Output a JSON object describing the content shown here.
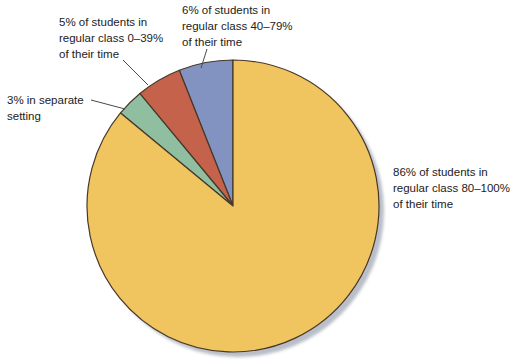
{
  "figure": {
    "kind": "pie-chart-figure",
    "background": "#ffffff",
    "text_color": "#222222",
    "leader_line_color": "#4a4a4a"
  },
  "chart_data": {
    "type": "pie",
    "title": "",
    "start_angle_deg": 90,
    "direction": "counterclockwise",
    "outline_color": "#473829",
    "shadow_color": "#b9bec8",
    "slices": [
      {
        "id": "regular-40-79",
        "category": "Regular class 40–79% of their time",
        "label": "6% of students in\nregular class 40–79%\nof their time",
        "value": 6,
        "color": "#8293c1"
      },
      {
        "id": "regular-0-39",
        "category": "Regular class 0–39% of their time",
        "label": "5% of students in\nregular class 0–39%\nof their time",
        "value": 5,
        "color": "#c4624c"
      },
      {
        "id": "separate-setting",
        "category": "Separate setting",
        "label": "3% in separate\nsetting",
        "value": 3,
        "color": "#8fbfa0"
      },
      {
        "id": "regular-80-100",
        "category": "Regular class 80–100% of their time",
        "label": "86% of students in\nregular class 80–100%\nof their time",
        "value": 86,
        "color": "#f0c45f"
      }
    ]
  }
}
